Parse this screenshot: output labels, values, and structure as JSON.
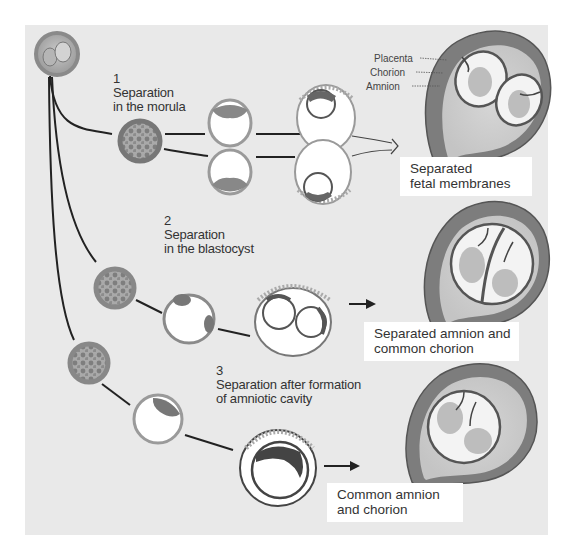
{
  "diagram": {
    "type": "biology-illustration",
    "colors": {
      "background": "#e9e9e9",
      "line": "#222222",
      "cell_ring": "#8a8a8a",
      "uterus_wall": "#7d7d7d",
      "label_box": "#ffffff",
      "text": "#333333"
    },
    "stages": [
      {
        "number": "1",
        "title_line1": "Separation",
        "title_line2": "in the morula",
        "result_line1": "Separated",
        "result_line2": "fetal membranes"
      },
      {
        "number": "2",
        "title_line1": "Separation",
        "title_line2": "in the blastocyst",
        "result_line1": "Separated amnion and",
        "result_line2": "common chorion"
      },
      {
        "number": "3",
        "title_line1": "Separation after formation",
        "title_line2": "of amniotic cavity",
        "result_line1": "Common amnion",
        "result_line2": "and chorion"
      }
    ],
    "membrane_labels": [
      "Placenta",
      "Chorion",
      "Amnion"
    ]
  }
}
